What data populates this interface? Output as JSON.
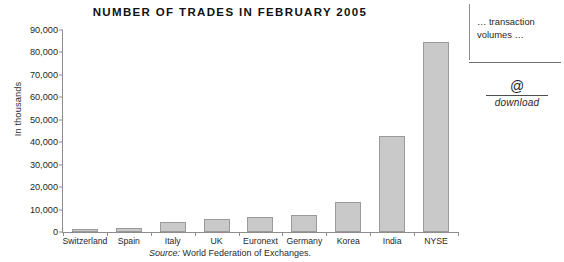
{
  "chart_data": {
    "type": "bar",
    "title": "NUMBER OF TRADES IN FEBRUARY 2005",
    "xlabel": "",
    "ylabel": "In thousands",
    "categories": [
      "Switzerland",
      "Spain",
      "Italy",
      "UK",
      "Euronext",
      "Germany",
      "Korea",
      "India",
      "NYSE"
    ],
    "values": [
      1300,
      1800,
      4500,
      5800,
      6700,
      7600,
      13400,
      42800,
      84700
    ],
    "ylim": [
      0,
      90000
    ],
    "ytick_labels": [
      "0",
      "10,000",
      "20,000",
      "30,000",
      "40,000",
      "50,000",
      "60,000",
      "70,000",
      "80,000",
      "90,000"
    ],
    "ytick_values": [
      0,
      10000,
      20000,
      30000,
      40000,
      50000,
      60000,
      70000,
      80000,
      90000
    ],
    "grid": false,
    "legend": false,
    "bar_color": "#c9c9c9",
    "bar_border_color": "#9a9a9a",
    "axis_color": "#8d8d8d"
  },
  "source": {
    "lead": "Source:",
    "text": " World Federation of Exchanges."
  },
  "side_panel": {
    "caption": "… transaction volumes …",
    "at_symbol": "@",
    "download_label": "download"
  }
}
